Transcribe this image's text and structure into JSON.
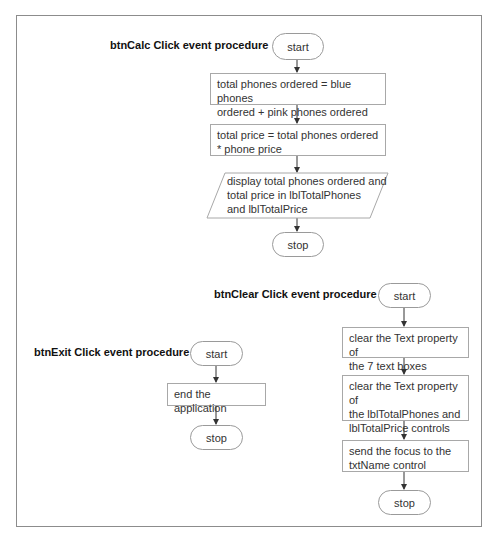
{
  "diagram": {
    "type": "flowchart",
    "procedures": [
      {
        "label": "btnCalc Click event procedure",
        "start": "start",
        "steps": [
          {
            "shape": "process",
            "text": "total phones ordered = blue phones ordered + pink phones ordered",
            "lines": [
              "total phones ordered = blue phones",
              "ordered + pink phones ordered"
            ]
          },
          {
            "shape": "process",
            "text": "total price = total phones ordered * phone price",
            "lines": [
              "total price = total phones ordered",
              "* phone price"
            ]
          },
          {
            "shape": "input-output",
            "text": "display total phones ordered and total price in lblTotalPhones and lblTotalPrice",
            "lines": [
              "display total phones ordered and",
              "total price in lblTotalPhones",
              "and lblTotalPrice"
            ]
          }
        ],
        "stop": "stop"
      },
      {
        "label": "btnClear Click event procedure",
        "start": "start",
        "steps": [
          {
            "shape": "process",
            "text": "clear the Text property of the 7 text boxes",
            "lines": [
              "clear the Text property of",
              "the 7 text boxes"
            ]
          },
          {
            "shape": "process",
            "text": "clear the Text property of the lblTotalPhones and lblTotalPrice controls",
            "lines": [
              "clear the Text property of",
              "the lblTotalPhones and",
              "lblTotalPrice controls"
            ]
          },
          {
            "shape": "process",
            "text": "send the focus to the txtName control",
            "lines": [
              "send the focus to the",
              "txtName control"
            ]
          }
        ],
        "stop": "stop"
      },
      {
        "label": "btnExit Click event procedure",
        "start": "start",
        "steps": [
          {
            "shape": "process",
            "text": "end the application",
            "lines": [
              "end the application"
            ]
          }
        ],
        "stop": "stop"
      }
    ],
    "colors": {
      "border": "#8c8c8c",
      "shape_border": "#a8a8a8",
      "text": "#333333",
      "arrow": "#333333"
    }
  }
}
